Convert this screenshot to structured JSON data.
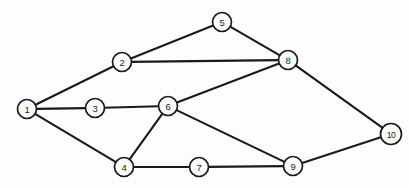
{
  "figure": {
    "kind": "undirected-graph-diagram",
    "background_color": "#fdfdfd",
    "line_color": "#1a1a1a",
    "node_fill_color": "#fdfdfd",
    "width": 409,
    "height": 187
  },
  "chart_data": {
    "type": "diagram",
    "title": "",
    "xlabel": "",
    "ylabel": "",
    "graph_type": "undirected",
    "node_count": 10,
    "edge_count": 14,
    "nodes": [
      {
        "id": "1",
        "label": "1",
        "x": 27,
        "y": 109,
        "r": 9.5
      },
      {
        "id": "2",
        "label": "2",
        "x": 122,
        "y": 62,
        "r": 9.5
      },
      {
        "id": "3",
        "label": "3",
        "x": 95,
        "y": 108,
        "r": 9.5
      },
      {
        "id": "4",
        "label": "4",
        "x": 124,
        "y": 167,
        "r": 9.5
      },
      {
        "id": "5",
        "label": "5",
        "x": 222,
        "y": 22,
        "r": 9.5
      },
      {
        "id": "6",
        "label": "6",
        "x": 168,
        "y": 106,
        "r": 9.5
      },
      {
        "id": "7",
        "label": "7",
        "x": 199,
        "y": 167,
        "r": 9.5
      },
      {
        "id": "8",
        "label": "8",
        "x": 288,
        "y": 60,
        "r": 9.5
      },
      {
        "id": "9",
        "label": "9",
        "x": 293,
        "y": 166,
        "r": 9.5
      },
      {
        "id": "10",
        "label": "10",
        "x": 391,
        "y": 134,
        "r": 10.5
      }
    ],
    "edges": [
      {
        "source": "1",
        "target": "2"
      },
      {
        "source": "1",
        "target": "3"
      },
      {
        "source": "1",
        "target": "4"
      },
      {
        "source": "2",
        "target": "5"
      },
      {
        "source": "2",
        "target": "8"
      },
      {
        "source": "3",
        "target": "6"
      },
      {
        "source": "4",
        "target": "6"
      },
      {
        "source": "4",
        "target": "7"
      },
      {
        "source": "5",
        "target": "8"
      },
      {
        "source": "6",
        "target": "8"
      },
      {
        "source": "6",
        "target": "9"
      },
      {
        "source": "7",
        "target": "9"
      },
      {
        "source": "8",
        "target": "10"
      },
      {
        "source": "9",
        "target": "10"
      }
    ]
  }
}
